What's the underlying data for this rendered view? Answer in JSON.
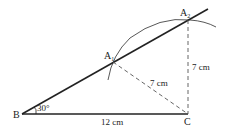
{
  "diagram": {
    "type": "geometry-construction",
    "points": {
      "B": {
        "label": "B",
        "x": 22,
        "y": 114
      },
      "C": {
        "label": "C",
        "x": 188,
        "y": 114
      },
      "A1": {
        "label": "A",
        "sub": "1",
        "x": 113,
        "y": 62
      },
      "A2": {
        "label": "A",
        "sub": "2",
        "x": 188,
        "y": 20
      }
    },
    "labels": {
      "angle": "30°",
      "base": "12 cm",
      "side_a1c": "7 cm",
      "side_a2c": "7 cm"
    },
    "colors": {
      "stroke": "#222222",
      "dashed": "#555555",
      "background": "#ffffff"
    }
  }
}
